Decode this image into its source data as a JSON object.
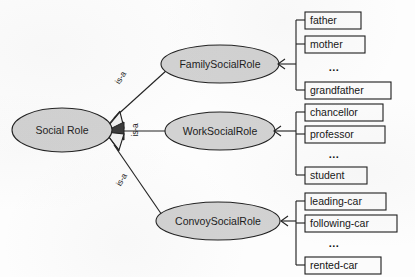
{
  "diagram": {
    "background_color": "#fdfdfd",
    "node_fill_color": "#d2d2d2",
    "node_stroke_color": "#202020",
    "box_fill_color": "#fbfbfb",
    "box_stroke_color": "#1c1c1c",
    "line_color": "#232323",
    "root": {
      "label": "Social Role",
      "cx": 62,
      "cy": 130,
      "rx": 50,
      "ry": 22
    },
    "relation_labels": [
      {
        "text": "is-a",
        "x": 121,
        "y": 78,
        "rotation": -58
      },
      {
        "text": "is-a",
        "x": 136,
        "y": 130,
        "rotation": -90
      },
      {
        "text": "is-a",
        "x": 122,
        "y": 180,
        "rotation": -60
      }
    ],
    "branches": [
      {
        "name": "family",
        "node": {
          "label": "FamilySocialRole",
          "cx": 220,
          "cy": 64,
          "rx": 59,
          "ry": 19
        },
        "spine_x": 296,
        "arrow_y": 64,
        "leaves": [
          {
            "text": "father",
            "x": 305,
            "y": 12,
            "w": 56,
            "h": 17,
            "kind": "box"
          },
          {
            "text": "mother",
            "x": 305,
            "y": 36,
            "w": 60,
            "h": 17,
            "kind": "box"
          },
          {
            "text": "...",
            "x": 305,
            "y": 59,
            "w": 60,
            "h": 17,
            "kind": "dots"
          },
          {
            "text": "grandfather",
            "x": 305,
            "y": 82,
            "w": 86,
            "h": 17,
            "kind": "box"
          }
        ]
      },
      {
        "name": "work",
        "node": {
          "label": "WorkSocialRole",
          "cx": 220,
          "cy": 131,
          "rx": 55,
          "ry": 19
        },
        "spine_x": 296,
        "arrow_y": 131,
        "leaves": [
          {
            "text": "chancellor",
            "x": 305,
            "y": 104,
            "w": 78,
            "h": 17,
            "kind": "box"
          },
          {
            "text": "professor",
            "x": 305,
            "y": 126,
            "w": 80,
            "h": 17,
            "kind": "box"
          },
          {
            "text": "...",
            "x": 305,
            "y": 147,
            "w": 60,
            "h": 17,
            "kind": "dots"
          },
          {
            "text": "student",
            "x": 305,
            "y": 167,
            "w": 62,
            "h": 17,
            "kind": "box"
          }
        ]
      },
      {
        "name": "convoy",
        "node": {
          "label": "ConvoySocialRole",
          "cx": 218,
          "cy": 221,
          "rx": 62,
          "ry": 19
        },
        "spine_x": 296,
        "arrow_y": 221,
        "leaves": [
          {
            "text": "leading-car",
            "x": 305,
            "y": 193,
            "w": 81,
            "h": 17,
            "kind": "box"
          },
          {
            "text": "following-car",
            "x": 305,
            "y": 215,
            "w": 92,
            "h": 17,
            "kind": "box"
          },
          {
            "text": "...",
            "x": 305,
            "y": 237,
            "w": 60,
            "h": 17,
            "kind": "dots"
          },
          {
            "text": "rented-car",
            "x": 305,
            "y": 257,
            "w": 76,
            "h": 17,
            "kind": "box"
          }
        ]
      }
    ]
  }
}
